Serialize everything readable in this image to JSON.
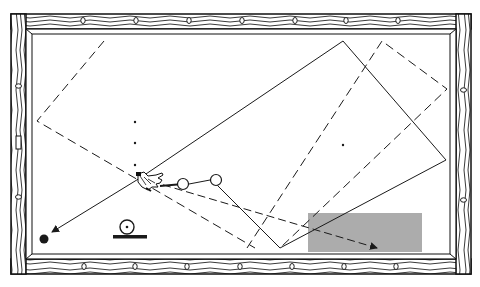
{
  "diagram": {
    "type": "billiard-table-shot-diagram",
    "colors": {
      "background": "#ffffff",
      "ink": "#1a1a1a",
      "rail_wood": "#ffffff",
      "shaded_zone": "#a8a8a8"
    },
    "table": {
      "frame": {
        "x": 11,
        "y": 14,
        "w": 460,
        "h": 260
      },
      "cushion": {
        "x": 31,
        "y": 33,
        "w": 424,
        "h": 223
      },
      "diamonds_top_x": [
        83,
        136,
        189,
        242,
        295,
        346,
        398
      ],
      "diamonds_bottom_x": [
        84,
        135,
        187,
        240,
        292,
        344,
        396
      ],
      "diamonds_left_y": [
        86,
        197
      ],
      "diamonds_right_y": [
        90,
        200
      ]
    },
    "markers": {
      "dots": [
        [
          135,
          122
        ],
        [
          135,
          143
        ],
        [
          135,
          165
        ],
        [
          343,
          145
        ]
      ],
      "object_balls": [
        [
          183,
          184
        ],
        [
          216,
          180
        ]
      ],
      "target_ball": [
        44,
        239
      ]
    },
    "paths": {
      "solid_cue_path": [
        [
          140,
          178
        ],
        [
          343,
          41
        ],
        [
          446,
          160
        ],
        [
          280,
          248
        ],
        [
          216,
          184
        ]
      ],
      "cue_line": [
        [
          160,
          186
        ],
        [
          183,
          184
        ]
      ],
      "ball_link": [
        [
          189,
          184
        ],
        [
          210,
          180
        ]
      ],
      "shot_arrow": [
        [
          140,
          178
        ],
        [
          52,
          232
        ]
      ],
      "dashed_left": [
        [
          104,
          41
        ],
        [
          37,
          121
        ],
        [
          255,
          248
        ]
      ],
      "dashed_right": [
        [
          247,
          248
        ],
        [
          382,
          41
        ],
        [
          447,
          89
        ],
        [
          280,
          248
        ]
      ],
      "dashed_arrow": [
        [
          140,
          178
        ],
        [
          377,
          248
        ]
      ]
    },
    "shaded_zone": {
      "x": 308,
      "y": 213,
      "w": 114,
      "h": 39
    },
    "legend_icon": {
      "name": "ball-on-rail-symbol",
      "cx": 127,
      "cy": 227,
      "r": 7
    }
  }
}
